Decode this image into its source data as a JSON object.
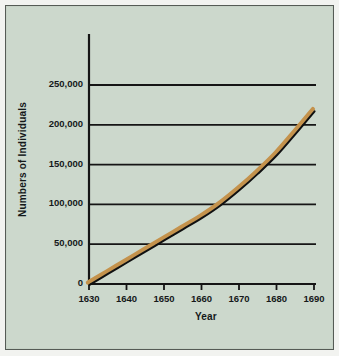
{
  "figure": {
    "background_color": "#ccd8cc",
    "border_color": "#555b55",
    "page_background": "#f2f3f0"
  },
  "chart_data": {
    "type": "line",
    "title": "",
    "xlabel": "Year",
    "ylabel": "Numbers of Individuals",
    "xlim": [
      1630,
      1690
    ],
    "ylim": [
      0,
      250000
    ],
    "grid": "horizontal",
    "legend": "none",
    "x_ticks": [
      1630,
      1640,
      1650,
      1660,
      1670,
      1680,
      1690
    ],
    "x_tick_labels": [
      "1630",
      "1640",
      "1650",
      "1660",
      "1670",
      "1680",
      "1690"
    ],
    "y_ticks": [
      0,
      50000,
      100000,
      150000,
      200000,
      250000
    ],
    "y_tick_labels": [
      "0",
      "50,000",
      "100,000",
      "150,000",
      "200,000",
      "250,000"
    ],
    "series": [
      {
        "name": "Population",
        "line_color": "#c4924c",
        "outline_color": "#101010",
        "x": [
          1630,
          1635,
          1640,
          1645,
          1650,
          1655,
          1660,
          1665,
          1670,
          1675,
          1680,
          1685,
          1690
        ],
        "values": [
          0,
          14000,
          28000,
          42000,
          56000,
          70000,
          84000,
          100000,
          119000,
          140000,
          163000,
          190000,
          218000
        ]
      }
    ]
  }
}
